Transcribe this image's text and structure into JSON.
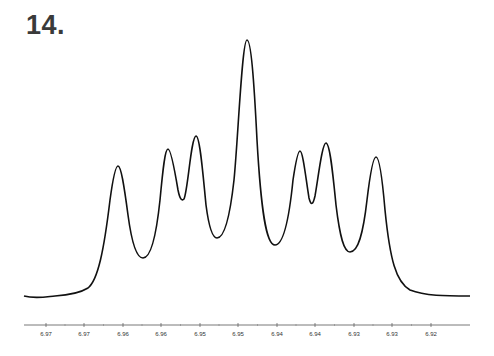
{
  "figure": {
    "label": "14."
  },
  "chart_data": {
    "type": "line",
    "title": "14.",
    "xlabel": "",
    "ylabel": "",
    "x_axis_reversed": true,
    "x_tick_labels": [
      "6.97",
      "6.97",
      "6.96",
      "6.96",
      "6.95",
      "6.95",
      "6.94",
      "6.94",
      "6.93",
      "6.93",
      "6.92"
    ],
    "xlim": [
      6.975,
      6.915
    ],
    "grid": false,
    "legend": null,
    "peaks": [
      {
        "ppm": 6.961,
        "relative_height": 0.51
      },
      {
        "ppm": 6.953,
        "relative_height": 0.58
      },
      {
        "ppm": 6.949,
        "relative_height": 0.63
      },
      {
        "ppm": 6.941,
        "relative_height": 1.0
      },
      {
        "ppm": 6.934,
        "relative_height": 0.57
      },
      {
        "ppm": 6.93,
        "relative_height": 0.6
      },
      {
        "ppm": 6.922,
        "relative_height": 0.55
      }
    ],
    "valleys": [
      {
        "ppm": 6.957,
        "relative_height": 0.15
      },
      {
        "ppm": 6.951,
        "relative_height": 0.37
      },
      {
        "ppm": 6.946,
        "relative_height": 0.23
      },
      {
        "ppm": 6.937,
        "relative_height": 0.2
      },
      {
        "ppm": 6.932,
        "relative_height": 0.36
      },
      {
        "ppm": 6.926,
        "relative_height": 0.17
      }
    ]
  },
  "axis": {
    "ticks": [
      {
        "x": 46,
        "label": "6.97"
      },
      {
        "x": 84,
        "label": "6.97"
      },
      {
        "x": 123,
        "label": "6.96"
      },
      {
        "x": 161,
        "label": "6.96"
      },
      {
        "x": 200,
        "label": "6.95"
      },
      {
        "x": 238,
        "label": "6.95"
      },
      {
        "x": 277,
        "label": "6.94"
      },
      {
        "x": 315,
        "label": "6.94"
      },
      {
        "x": 354,
        "label": "6.93"
      },
      {
        "x": 392,
        "label": "6.93"
      },
      {
        "x": 431,
        "label": "6.92"
      }
    ]
  },
  "style": {
    "line_color": "#111111",
    "axis_color": "#555555",
    "background": "#ffffff"
  }
}
